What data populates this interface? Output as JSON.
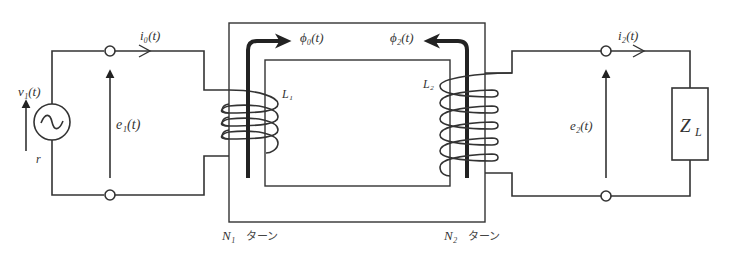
{
  "diagram": {
    "type": "transformer-circuit",
    "colors": {
      "line": "#333333",
      "flux_arrow": "#222222",
      "background": "#ffffff"
    },
    "primary": {
      "source_label": "v₁(t)",
      "source_resistance_label": "r",
      "source_icon": "ac-source-icon",
      "current_label": "i₀(t)",
      "voltage_label": "e₁(t)",
      "inductor_label": "L₁",
      "turns_label": "N₁",
      "turns_suffix": "ターン"
    },
    "secondary": {
      "current_label": "i₂(t)",
      "voltage_label": "e₂(t)",
      "inductor_label": "L₂",
      "turns_label": "N₂",
      "turns_suffix": "ターン",
      "load_label": "Z",
      "load_subscript": "L"
    },
    "core": {
      "flux_primary_label": "ϕ₀(t)",
      "flux_secondary_label": "ϕ₂(t)"
    }
  }
}
